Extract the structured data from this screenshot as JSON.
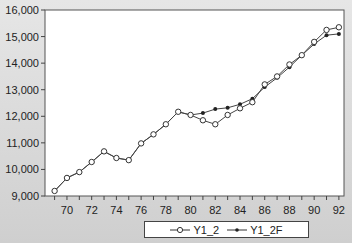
{
  "chart_data": {
    "type": "line",
    "title": "",
    "xlabel": "",
    "ylabel": "",
    "ylim": [
      9000,
      16000
    ],
    "xlim": [
      68.5,
      92.5
    ],
    "grid": false,
    "legend_position": "bottom",
    "yticks": [
      9000,
      10000,
      11000,
      12000,
      13000,
      14000,
      15000,
      16000
    ],
    "ytick_labels": [
      "9,000",
      "10,000",
      "11,000",
      "12,000",
      "13,000",
      "14,000",
      "15,000",
      "16,000"
    ],
    "xticks": [
      70,
      72,
      74,
      76,
      78,
      80,
      82,
      84,
      86,
      88,
      90,
      92
    ],
    "xtick_labels": [
      "70",
      "72",
      "74",
      "76",
      "78",
      "80",
      "82",
      "84",
      "86",
      "88",
      "90",
      "92"
    ],
    "x": [
      69,
      70,
      71,
      72,
      73,
      74,
      75,
      76,
      77,
      78,
      79,
      80,
      81,
      82,
      83,
      84,
      85,
      86,
      87,
      88,
      89,
      90,
      91,
      92
    ],
    "series": [
      {
        "name": "Y1_2",
        "marker": "open-circle",
        "values": [
          9190,
          9680,
          9900,
          10280,
          10680,
          10430,
          10350,
          10980,
          11320,
          11700,
          12170,
          12050,
          11850,
          11700,
          12050,
          12300,
          12530,
          13200,
          13500,
          13950,
          14300,
          14800,
          15250,
          15350
        ]
      },
      {
        "name": "Y1_2F",
        "marker": "filled-dot",
        "values": [
          9190,
          9680,
          9900,
          10280,
          10680,
          10430,
          10350,
          10980,
          11320,
          11700,
          12170,
          12050,
          12120,
          12270,
          12320,
          12450,
          12660,
          13100,
          13450,
          13850,
          14300,
          14720,
          15050,
          15100
        ]
      }
    ]
  },
  "legend": {
    "items": [
      {
        "label": "Y1_2"
      },
      {
        "label": "Y1_2F"
      }
    ]
  }
}
